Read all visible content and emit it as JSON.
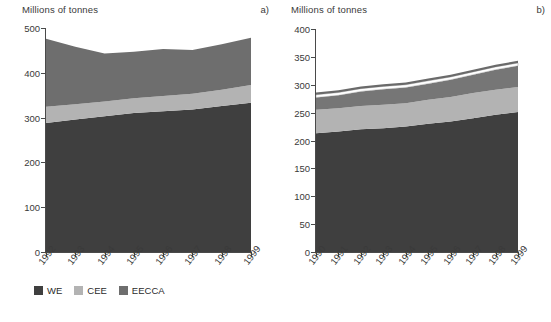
{
  "panels": {
    "a": {
      "tag": "a)",
      "axis_title": "Millions of tonnes",
      "yticks": [
        "0",
        "100",
        "200",
        "300",
        "400",
        "500"
      ],
      "xticks": [
        "1992",
        "1993",
        "1994",
        "1995",
        "1996",
        "1997",
        "1998",
        "1999"
      ],
      "legend": [
        {
          "label": "WE",
          "color": "#3f3f3f"
        },
        {
          "label": "CEE",
          "color": "#b3b3b3"
        },
        {
          "label": "EECCA",
          "color": "#6e6e6e"
        }
      ]
    },
    "b": {
      "tag": "b)",
      "axis_title": "Millions of tonnes",
      "yticks": [
        "0",
        "50",
        "100",
        "150",
        "200",
        "250",
        "300",
        "350",
        "400"
      ],
      "xticks": [
        "1990",
        "1991",
        "1992",
        "1993",
        "1994",
        "1995",
        "1996",
        "1997",
        "1998",
        "1999"
      ],
      "legend_row1": [
        {
          "label": "Road",
          "color": "#3f3f3f"
        },
        {
          "label": "Marine bunkers",
          "color": "#b3b3b3"
        },
        {
          "label": "Aviation",
          "color": "#767676"
        }
      ],
      "legend_row2": [
        {
          "label": "Rail",
          "color": "#ffffff"
        },
        {
          "label": "Inland navigation",
          "color": "#6a6a6a"
        }
      ]
    }
  },
  "chart_data": [
    {
      "type": "area",
      "id": "chart-a",
      "title": "",
      "subtitle": "a)",
      "xlabel": "",
      "ylabel": "Millions of tonnes",
      "stacked": true,
      "grid": false,
      "legend_position": "bottom",
      "ylim": [
        0,
        500
      ],
      "ytick_values": [
        0,
        100,
        200,
        300,
        400,
        500
      ],
      "categories": [
        "1992",
        "1993",
        "1994",
        "1995",
        "1996",
        "1997",
        "1998",
        "1999"
      ],
      "series": [
        {
          "name": "WE",
          "color": "#3f3f3f",
          "values": [
            288,
            296,
            303,
            310,
            314,
            318,
            326,
            333
          ]
        },
        {
          "name": "CEE",
          "color": "#b3b3b3",
          "values": [
            36,
            34,
            33,
            33,
            34,
            35,
            36,
            40
          ]
        },
        {
          "name": "EECCA",
          "color": "#6e6e6e",
          "values": [
            152,
            128,
            107,
            104,
            105,
            98,
            102,
            105
          ]
        }
      ],
      "totals": [
        476,
        458,
        443,
        447,
        453,
        451,
        464,
        478
      ]
    },
    {
      "type": "area",
      "id": "chart-b",
      "title": "",
      "subtitle": "b)",
      "xlabel": "",
      "ylabel": "Millions of tonnes",
      "stacked": true,
      "grid": false,
      "legend_position": "bottom",
      "ylim": [
        0,
        400
      ],
      "ytick_values": [
        0,
        50,
        100,
        150,
        200,
        250,
        300,
        350,
        400
      ],
      "categories": [
        "1990",
        "1991",
        "1992",
        "1993",
        "1994",
        "1995",
        "1996",
        "1997",
        "1998",
        "1999"
      ],
      "series": [
        {
          "name": "Road",
          "color": "#3f3f3f",
          "values": [
            213,
            216,
            220,
            222,
            225,
            230,
            234,
            240,
            246,
            251
          ]
        },
        {
          "name": "Marine bunkers",
          "color": "#b3b3b3",
          "values": [
            42,
            42,
            42,
            42,
            42,
            43,
            44,
            45,
            45,
            45
          ]
        },
        {
          "name": "Aviation",
          "color": "#767676",
          "values": [
            22,
            23,
            26,
            28,
            28,
            29,
            31,
            33,
            36,
            38
          ]
        },
        {
          "name": "Rail",
          "color": "#ffffff",
          "values": [
            5,
            5,
            5,
            5,
            5,
            5,
            5,
            5,
            5,
            5
          ]
        },
        {
          "name": "Inland navigation",
          "color": "#6a6a6a",
          "values": [
            4,
            4,
            4,
            4,
            4,
            4,
            4,
            4,
            4,
            4
          ]
        }
      ],
      "totals": [
        286,
        290,
        297,
        301,
        304,
        311,
        318,
        327,
        336,
        343
      ]
    }
  ]
}
